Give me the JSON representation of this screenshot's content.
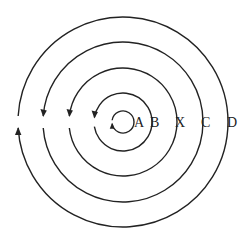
{
  "diagram": {
    "center": [
      123,
      122
    ],
    "stroke_color": "#222222",
    "background": "#ffffff",
    "rings": [
      {
        "id": "A",
        "label": "A",
        "radius": 11,
        "arrow": "up",
        "label_x": 140
      },
      {
        "id": "B",
        "label": "B",
        "radius": 29,
        "arrow": "down",
        "label_x": 156
      },
      {
        "id": "X",
        "label": "X",
        "radius": 54,
        "arrow": "down",
        "label_x": 181
      },
      {
        "id": "C",
        "label": "C",
        "radius": 80,
        "arrow": "down",
        "label_x": 207
      },
      {
        "id": "D",
        "label": "D",
        "radius": 105,
        "arrow": "up",
        "label_x": 233
      }
    ]
  }
}
